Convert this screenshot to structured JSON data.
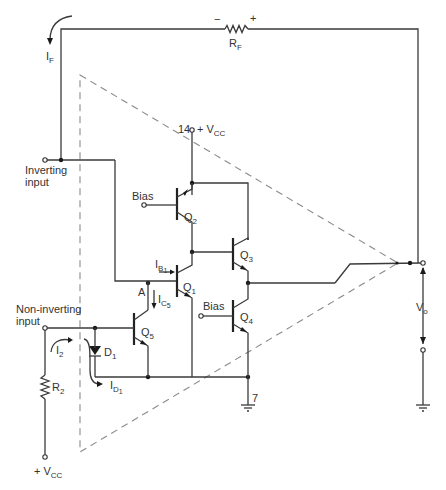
{
  "diagram": {
    "type": "op-amp internal schematic with feedback",
    "components": {
      "feedback_resistor": {
        "name": "R",
        "sub": "F",
        "polarity_minus": "−",
        "polarity_plus": "+"
      },
      "feedback_current": {
        "name": "I",
        "sub": "F"
      },
      "supply_pin": {
        "pin": "14",
        "label": "+ V",
        "sub": "CC"
      },
      "ground_pin": {
        "pin": "7"
      },
      "inputs": {
        "inverting": {
          "line1": "Inverting",
          "line2": "input"
        },
        "noninverting": {
          "line1": "Non-inverting",
          "line2": "input"
        }
      },
      "transistors": [
        {
          "id": "Q2",
          "name": "Q",
          "sub": "2",
          "base_label": "Bias"
        },
        {
          "id": "Q1",
          "name": "Q",
          "sub": "1"
        },
        {
          "id": "Q3",
          "name": "Q",
          "sub": "3"
        },
        {
          "id": "Q4",
          "name": "Q",
          "sub": "4",
          "base_label": "Bias"
        },
        {
          "id": "Q5",
          "name": "Q",
          "sub": "5"
        }
      ],
      "diode": {
        "name": "D",
        "sub": "1"
      },
      "node_A": "A",
      "currents": {
        "IB1": {
          "name": "I",
          "sub": "B",
          "subsub": "1"
        },
        "IC5": {
          "name": "I",
          "sub": "C",
          "subsub": "5"
        },
        "I2": {
          "name": "I",
          "sub": "2"
        },
        "ID1": {
          "name": "I",
          "sub": "D",
          "subsub": "1"
        }
      },
      "input_resistor": {
        "name": "R",
        "sub": "2"
      },
      "bottom_supply": {
        "label": "+ V",
        "sub": "CC"
      },
      "output_voltage": {
        "name": "V",
        "sub": "o"
      }
    }
  }
}
